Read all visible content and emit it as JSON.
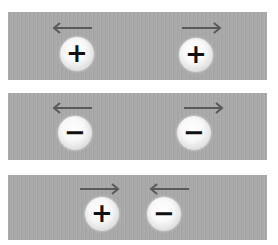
{
  "colors": {
    "panel": "#a9a9a9",
    "arrow": "#5a5a5a",
    "sign": "#111111"
  },
  "panels": [
    {
      "name": "like-positive-charges-repel",
      "charges": [
        {
          "sign": "+",
          "arrow": "left"
        },
        {
          "sign": "+",
          "arrow": "right"
        }
      ]
    },
    {
      "name": "like-negative-charges-repel",
      "charges": [
        {
          "sign": "−",
          "arrow": "left"
        },
        {
          "sign": "−",
          "arrow": "right"
        }
      ]
    },
    {
      "name": "opposite-charges-attract",
      "charges": [
        {
          "sign": "+",
          "arrow": "right"
        },
        {
          "sign": "−",
          "arrow": "left"
        }
      ]
    }
  ]
}
